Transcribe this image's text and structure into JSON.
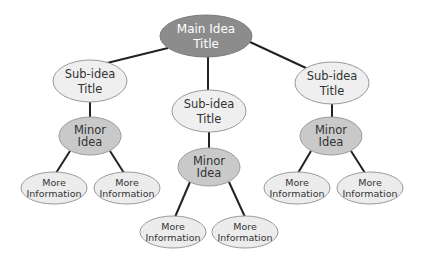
{
  "diagram": {
    "type": "concept-map",
    "colors": {
      "main_fill": "#8c8c8c",
      "main_text": "#ffffff",
      "sub_fill": "#efefef",
      "minor_fill": "#c9c9c9",
      "info_fill": "#ececec",
      "stroke": "#9a9a9a",
      "connector": "#222222",
      "text": "#333333"
    },
    "main": {
      "line1": "Main Idea",
      "line2": "Title"
    },
    "branches": [
      {
        "sub": {
          "line1": "Sub-idea",
          "line2": "Title"
        },
        "minor": {
          "line1": "Minor",
          "line2": "Idea"
        },
        "info": [
          {
            "line1": "More",
            "line2": "Information"
          },
          {
            "line1": "More",
            "line2": "Information"
          }
        ]
      },
      {
        "sub": {
          "line1": "Sub-idea",
          "line2": "Title"
        },
        "minor": {
          "line1": "Minor",
          "line2": "Idea"
        },
        "info": [
          {
            "line1": "More",
            "line2": "Information"
          },
          {
            "line1": "More",
            "line2": "Information"
          }
        ]
      },
      {
        "sub": {
          "line1": "Sub-idea",
          "line2": "Title"
        },
        "minor": {
          "line1": "Minor",
          "line2": "Idea"
        },
        "info": [
          {
            "line1": "More",
            "line2": "Information"
          },
          {
            "line1": "More",
            "line2": "Information"
          }
        ]
      }
    ]
  }
}
